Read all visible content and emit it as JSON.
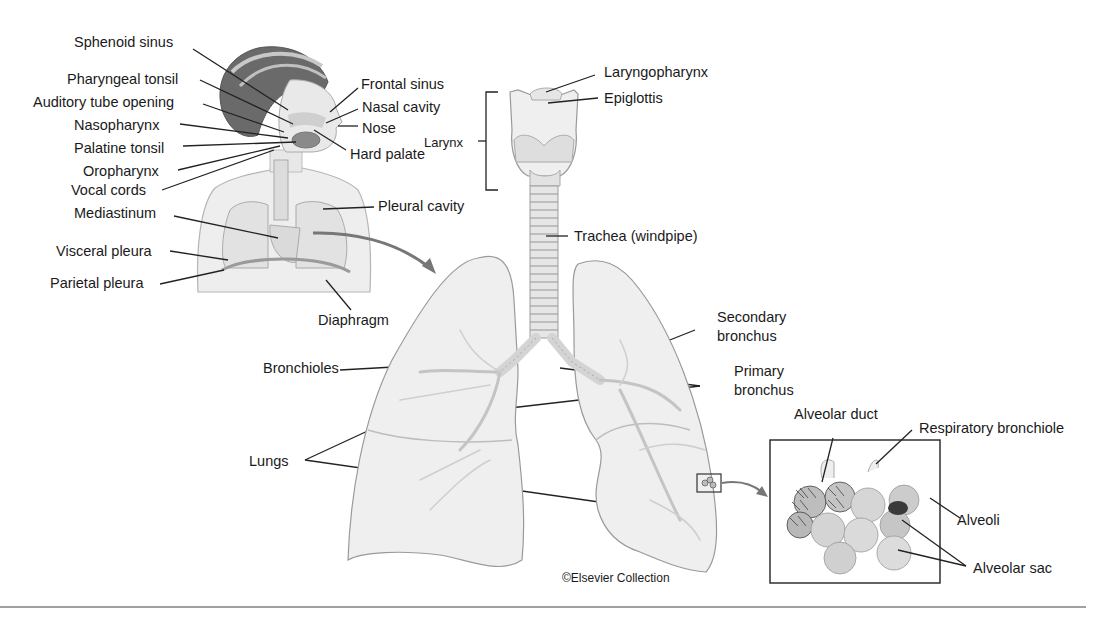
{
  "figure": {
    "credit": "©Elsevier Collection"
  },
  "head_labels_left": [
    "Sphenoid sinus",
    "Pharyngeal tonsil",
    "Auditory tube opening",
    "Nasopharynx",
    "Palatine tonsil",
    "Oropharynx",
    "Vocal cords",
    "Mediastinum",
    "Visceral pleura",
    "Parietal pleura"
  ],
  "head_labels_right": [
    "Frontal sinus",
    "Nasal cavity",
    "Nose",
    "Hard palate",
    "Pleural cavity",
    "Diaphragm"
  ],
  "airway_labels": {
    "larynx": "Larynx",
    "laryngopharynx": "Laryngopharynx",
    "epiglottis": "Epiglottis",
    "trachea": "Trachea (windpipe)",
    "secondary_bronchus_1": "Secondary",
    "secondary_bronchus_2": "bronchus",
    "primary_bronchus_1": "Primary",
    "primary_bronchus_2": "bronchus",
    "bronchioles": "Bronchioles",
    "lungs": "Lungs"
  },
  "inset_labels": {
    "alveolar_duct": "Alveolar duct",
    "respiratory_bronchiole": "Respiratory bronchiole",
    "alveoli": "Alveoli",
    "alveolar_sac": "Alveolar sac"
  },
  "colors": {
    "background": "#ffffff",
    "text": "#1a1a1a",
    "rule": "#a0a0a0"
  }
}
